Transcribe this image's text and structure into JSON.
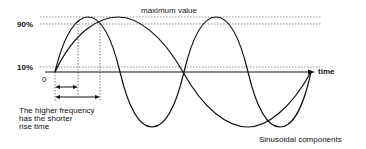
{
  "diagram": {
    "labels": {
      "maximum_value": "maximum value",
      "pct90": "90%",
      "pct10": "10%",
      "zero": "0",
      "time_axis": "time",
      "caption_line1": "The higher frequency",
      "caption_line2": "has the shorter",
      "caption_line3": "rise time",
      "components": "Sinusoidal components"
    },
    "reference_lines": [
      "maximum value",
      "90%",
      "10%"
    ],
    "waves": [
      {
        "name": "higher-frequency sinusoid",
        "relative_period": 1
      },
      {
        "name": "lower-frequency sinusoid",
        "relative_period": 2
      }
    ],
    "annotations": [
      "short rise time arrow (higher frequency)",
      "long rise time arrow (lower frequency)"
    ]
  }
}
